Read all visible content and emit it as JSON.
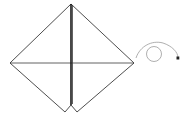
{
  "diagram": {
    "type": "origami-fold-step",
    "shape": "diamond-with-center-slit",
    "colors": {
      "outline": "#3a3a3a",
      "center_line": "#1a1a1a",
      "turn_arrow": "#9a9a9a",
      "arrowhead": "#222222",
      "background": "#ffffff"
    },
    "points": {
      "top": [
        71,
        4
      ],
      "left": [
        10,
        63
      ],
      "right": [
        134,
        63
      ],
      "bottom_left_tip": [
        65,
        112
      ],
      "bottom_notch": [
        71,
        105
      ],
      "bottom_right_tip": [
        77,
        112
      ]
    },
    "symbols": [
      "turn-over-arrow"
    ]
  }
}
